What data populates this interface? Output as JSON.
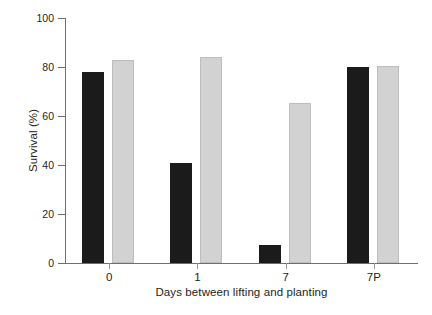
{
  "chart_data": {
    "type": "bar",
    "title": "",
    "subtitle": "",
    "xlabel": "Days between lifting and planting",
    "ylabel": "Survival (%)",
    "categories": [
      "0",
      "1",
      "7",
      "7P"
    ],
    "series": [
      {
        "name": "dark",
        "color": "#1b1b1b",
        "values": [
          78,
          41,
          7.5,
          80
        ]
      },
      {
        "name": "light",
        "color": "#d2d2d2",
        "values": [
          83,
          84,
          65.5,
          80.5
        ]
      }
    ],
    "ylim": [
      0,
      100
    ],
    "yticks": [
      0,
      20,
      40,
      60,
      80,
      100
    ],
    "ytick_labels": [
      "0",
      "20",
      "40",
      "60",
      "80",
      "100"
    ],
    "grid": false,
    "legend": "none"
  },
  "axes": {
    "y_axis_label": "Survival (%)",
    "x_axis_label": "Days between lifting and planting"
  }
}
